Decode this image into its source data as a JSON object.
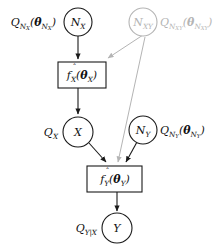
{
  "diagram": {
    "background_color": "#ffffff",
    "stroke_color": "#1a1a1a",
    "muted_color": "#b4b4b4",
    "nodes": [
      {
        "id": "n_x",
        "kind": "circle-node",
        "base": "N",
        "sub": "X",
        "muted": false,
        "side_label": {
          "text": "Q_{N_X}(θ_{N_X})",
          "base": "Q",
          "sub": "N",
          "subsub": "X",
          "arg_base": "θ",
          "arg_sub": "N",
          "arg_subsub": "X",
          "muted": false
        }
      },
      {
        "id": "n_xy",
        "kind": "circle-node",
        "base": "N",
        "sub": "XY",
        "muted": true,
        "side_label": {
          "text": "Q_{N_XY}(θ_{N_XY})",
          "base": "Q",
          "sub": "N",
          "subsub": "XY",
          "arg_base": "θ",
          "arg_sub": "N",
          "arg_subsub": "XY",
          "muted": true
        }
      },
      {
        "id": "x",
        "kind": "circle-node",
        "base": "X",
        "sub": "",
        "muted": false,
        "side_label": {
          "text": "Q_X",
          "base": "Q",
          "sub": "X",
          "subsub": "",
          "arg_base": "",
          "arg_sub": "",
          "arg_subsub": "",
          "muted": false
        }
      },
      {
        "id": "n_y",
        "kind": "circle-node",
        "base": "N",
        "sub": "Y",
        "muted": false,
        "side_label": {
          "text": "Q_{N_Y}(θ_{N_Y})",
          "base": "Q",
          "sub": "N",
          "subsub": "Y",
          "arg_base": "θ",
          "arg_sub": "N",
          "arg_subsub": "Y",
          "muted": false
        }
      },
      {
        "id": "y",
        "kind": "circle-node",
        "base": "Y",
        "sub": "",
        "muted": false,
        "side_label": {
          "text": "Q_{Y|X}",
          "base": "Q",
          "sub": "Y|X",
          "subsub": "",
          "arg_base": "",
          "arg_sub": "",
          "arg_subsub": "",
          "muted": false
        }
      },
      {
        "id": "f_x",
        "kind": "function-box",
        "base": "f",
        "hat": true,
        "sub": "X",
        "arg_base": "θ",
        "arg_sub": "X",
        "muted": false
      },
      {
        "id": "f_y",
        "kind": "function-box",
        "base": "f",
        "hat": true,
        "sub": "Y",
        "arg_base": "θ",
        "arg_sub": "Y",
        "muted": false
      }
    ],
    "edges": [
      {
        "from": "n_x",
        "to": "f_x",
        "muted": false
      },
      {
        "from": "n_xy",
        "to": "f_x",
        "muted": true
      },
      {
        "from": "f_x",
        "to": "x",
        "muted": false
      },
      {
        "from": "x",
        "to": "f_y",
        "muted": false
      },
      {
        "from": "n_xy",
        "to": "f_y",
        "muted": true
      },
      {
        "from": "n_y",
        "to": "f_y",
        "muted": false
      },
      {
        "from": "f_y",
        "to": "y",
        "muted": false
      }
    ]
  }
}
